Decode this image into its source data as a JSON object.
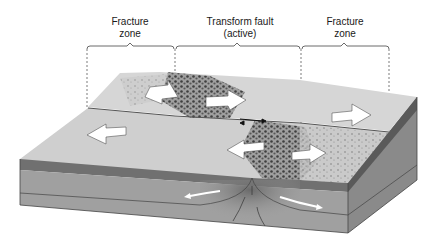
{
  "diagram": {
    "labels": [
      {
        "line1": "Fracture",
        "line2": "zone"
      },
      {
        "line1": "Transform fault",
        "line2": "(active)"
      },
      {
        "line1": "Fracture",
        "line2": "zone"
      }
    ],
    "colors": {
      "surface_light": "#d9d9d9",
      "surface_mid": "#c4c4c4",
      "rough_dark": "#3a3a3a",
      "crust_layer": "#707070",
      "mantle_layer": "#9e9e9e",
      "side_dark": "#6a6a6a",
      "arrow_fill": "#ffffff",
      "line": "#333333"
    }
  }
}
